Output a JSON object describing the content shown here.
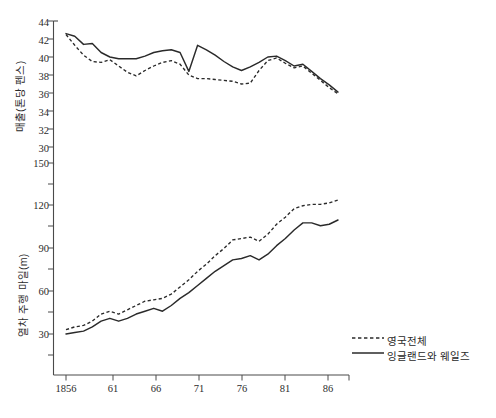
{
  "chart_data": [
    {
      "type": "line",
      "panel": "top",
      "title": "",
      "xlabel": "",
      "ylabel": "매출(톤당 펜스)",
      "xlim": [
        1856,
        1888
      ],
      "ylim": [
        30,
        44
      ],
      "yticks": [
        30,
        32,
        34,
        36,
        38,
        40,
        42,
        44
      ],
      "ytick_labels": [
        "30",
        "32",
        "34",
        "36",
        "38",
        "40",
        "42",
        "44"
      ],
      "xticks": [
        1856,
        1861,
        1866,
        1871,
        1876,
        1881,
        1886
      ],
      "xtick_labels": [
        "1856",
        "61",
        "66",
        "71",
        "76",
        "81",
        "86"
      ],
      "grid": false,
      "legend_position": "lower-right",
      "x": [
        1856,
        1857,
        1858,
        1859,
        1860,
        1861,
        1862,
        1863,
        1864,
        1865,
        1866,
        1867,
        1868,
        1869,
        1870,
        1871,
        1872,
        1873,
        1874,
        1875,
        1876,
        1877,
        1878,
        1879,
        1880,
        1881,
        1882,
        1883,
        1884,
        1885,
        1886,
        1887
      ],
      "series": [
        {
          "name": "영국전체",
          "style": "dashed",
          "values": [
            42.5,
            41.3,
            40.2,
            39.5,
            39.4,
            39.7,
            39.0,
            38.3,
            37.9,
            38.5,
            39.0,
            39.4,
            39.6,
            39.2,
            38.0,
            37.6,
            37.6,
            37.5,
            37.4,
            37.3,
            37.0,
            37.1,
            38.5,
            39.6,
            39.9,
            39.3,
            38.8,
            39.0,
            38.2,
            37.4,
            36.6,
            35.9
          ]
        },
        {
          "name": "잉글랜드와 웨일즈",
          "style": "solid",
          "values": [
            42.6,
            42.3,
            41.4,
            41.5,
            40.5,
            40.0,
            39.8,
            39.8,
            39.8,
            40.1,
            40.5,
            40.7,
            40.8,
            40.5,
            38.4,
            41.3,
            40.8,
            40.2,
            39.5,
            38.9,
            38.5,
            38.9,
            39.4,
            40.0,
            40.1,
            39.6,
            39.0,
            39.2,
            38.4,
            37.6,
            36.9,
            36.1
          ]
        }
      ]
    },
    {
      "type": "line",
      "panel": "bottom",
      "title": "",
      "xlabel": "",
      "ylabel": "열차 주행 마일(m)",
      "xlim": [
        1856,
        1888
      ],
      "ylim": [
        15,
        150
      ],
      "yticks": [
        30,
        60,
        90,
        120,
        150
      ],
      "ytick_labels": [
        "30",
        "60",
        "90",
        "120",
        "150"
      ],
      "xticks": [
        1856,
        1861,
        1866,
        1871,
        1876,
        1881,
        1886
      ],
      "xtick_labels": [
        "1856",
        "61",
        "66",
        "71",
        "76",
        "81",
        "86"
      ],
      "grid": false,
      "legend_position": "lower-right",
      "x": [
        1856,
        1857,
        1858,
        1859,
        1860,
        1861,
        1862,
        1863,
        1864,
        1865,
        1866,
        1867,
        1868,
        1869,
        1870,
        1871,
        1872,
        1873,
        1874,
        1875,
        1876,
        1877,
        1878,
        1879,
        1880,
        1881,
        1882,
        1883,
        1884,
        1885,
        1886,
        1887
      ],
      "series": [
        {
          "name": "영국전체",
          "style": "dashed",
          "values": [
            33,
            35,
            36,
            39,
            44,
            46,
            44,
            47,
            50,
            53,
            54,
            55,
            58,
            63,
            68,
            74,
            79,
            85,
            90,
            96,
            97,
            98,
            95,
            100,
            107,
            112,
            118,
            120,
            121,
            121,
            122,
            124
          ]
        },
        {
          "name": "잉글랜드와 웨일즈",
          "style": "solid",
          "values": [
            30,
            31,
            32,
            35,
            39,
            41,
            39,
            41,
            44,
            46,
            48,
            46,
            50,
            55,
            59,
            64,
            69,
            74,
            78,
            82,
            83,
            85,
            82,
            86,
            92,
            97,
            103,
            108,
            108,
            106,
            107,
            110
          ]
        }
      ]
    }
  ],
  "axes": {
    "top_ylabel": "매출(톤당 펜스)",
    "bottom_ylabel": "열차 주행 마일(m)",
    "top_ytick_labels": [
      "44",
      "42",
      "40",
      "38",
      "36",
      "34",
      "32",
      "30"
    ],
    "bottom_ytick_labels": [
      "150",
      "120",
      "90",
      "60",
      "30"
    ],
    "xtick_labels": [
      "1856",
      "61",
      "66",
      "71",
      "76",
      "81",
      "86"
    ]
  },
  "legend": {
    "items": [
      {
        "label": "영국전체",
        "style": "dashed"
      },
      {
        "label": "잉글랜드와 웨일즈",
        "style": "solid"
      }
    ]
  },
  "colors": {
    "ink": "#2a2a2a",
    "axis": "#4a4a4a",
    "background": "#ffffff"
  }
}
